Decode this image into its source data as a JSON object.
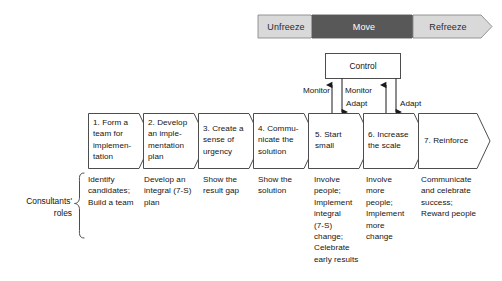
{
  "diagram": {
    "colors": {
      "unfreeze_fill": "#d9d9d9",
      "move_fill": "#585858",
      "refreeze_fill": "#d9d9d9",
      "move_text": "#ffffff",
      "phase_text": "#2b2b2b",
      "stroke": "#4d4d4d",
      "box_fill": "#ffffff",
      "text": "#141414"
    }
  },
  "phases": [
    {
      "id": "unfreeze",
      "label": "Unfreeze",
      "style": "light"
    },
    {
      "id": "move",
      "label": "Move",
      "style": "dark"
    },
    {
      "id": "refreeze",
      "label": "Refreeze",
      "style": "light"
    }
  ],
  "control": {
    "label": "Control"
  },
  "edges": [
    {
      "id": "monitor-5",
      "label": "Monitor"
    },
    {
      "id": "monitor-6",
      "label": "Monitor"
    },
    {
      "id": "adapt-5",
      "label": "Adapt"
    },
    {
      "id": "adapt-6",
      "label": "Adapt"
    }
  ],
  "steps": [
    {
      "id": "step-1",
      "label": "1. Form a\nteam for\nimplemen-\ntation"
    },
    {
      "id": "step-2",
      "label": "2. Develop\nan imple-\nmentation\nplan"
    },
    {
      "id": "step-3",
      "label": "3. Create a\nsense of\nurgency"
    },
    {
      "id": "step-4",
      "label": "4. Commu-\nnicate the\nsolution"
    },
    {
      "id": "step-5",
      "label": "5. Start\nsmall"
    },
    {
      "id": "step-6",
      "label": "6. Increase\nthe scale"
    },
    {
      "id": "step-7",
      "label": "7. Reinforce"
    }
  ],
  "roles": [
    {
      "id": "role-1",
      "text": "Identify\ncandidates;\nBuild a team"
    },
    {
      "id": "role-2",
      "text": "Develop an\nintegral (7-S)\nplan"
    },
    {
      "id": "role-3",
      "text": "Show the\nresult gap"
    },
    {
      "id": "role-4",
      "text": "Show the\nsolution"
    },
    {
      "id": "role-5",
      "text": "Involve\npeople;\nImplement\nintegral\n(7-S)\nchange;\nCelebrate\nearly results"
    },
    {
      "id": "role-6",
      "text": "Involve\nmore\npeople;\nImplement\nmore\nchange"
    },
    {
      "id": "role-7",
      "text": "Communicate\nand celebrate\nsuccess;\nReward people"
    }
  ],
  "side_caption": {
    "text": "Consultants'\nroles"
  }
}
